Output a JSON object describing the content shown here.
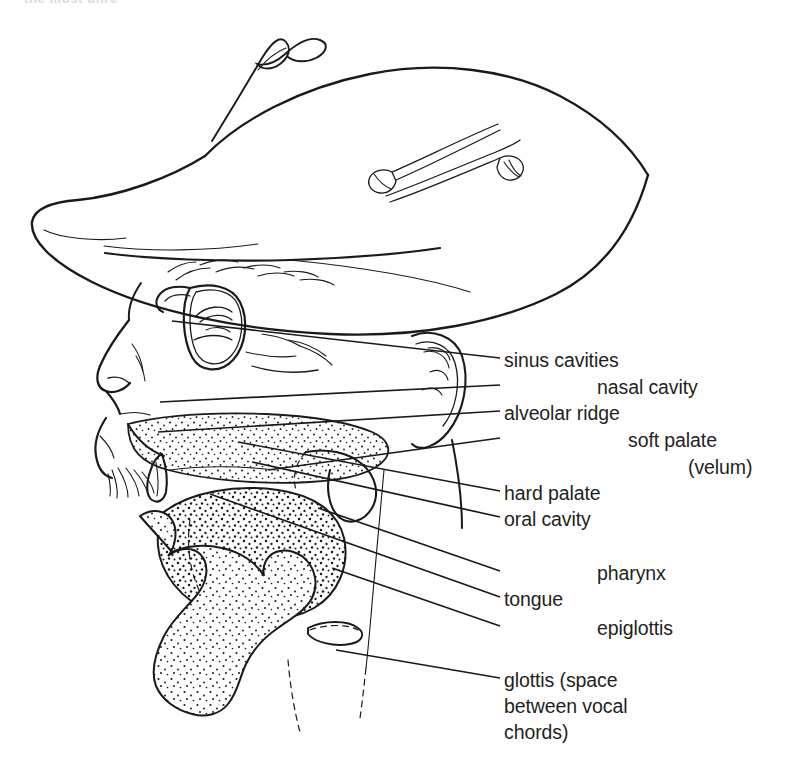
{
  "figure": {
    "clipped_header_text": "the most unre",
    "ink_color": "#1a1a1a",
    "text_color": "#231f20",
    "background_color": "#ffffff"
  },
  "labels": [
    {
      "id": "sinus-cavities",
      "text": "sinus cavities",
      "x": 504,
      "y": 348,
      "leader": true
    },
    {
      "id": "nasal-cavity",
      "text": "nasal cavity",
      "x": 597,
      "y": 375,
      "leader": true
    },
    {
      "id": "alveolar-ridge",
      "text": "alveolar ridge",
      "x": 504,
      "y": 401,
      "leader": true
    },
    {
      "id": "soft-palate",
      "text": "soft palate",
      "x": 628,
      "y": 428,
      "leader": true
    },
    {
      "id": "velum",
      "text": "(velum)",
      "x": 688,
      "y": 455,
      "leader": false
    },
    {
      "id": "hard-palate",
      "text": "hard palate",
      "x": 504,
      "y": 481,
      "leader": true
    },
    {
      "id": "oral-cavity",
      "text": "oral cavity",
      "x": 504,
      "y": 507,
      "leader": true
    },
    {
      "id": "pharynx",
      "text": "pharynx",
      "x": 597,
      "y": 561,
      "leader": true
    },
    {
      "id": "tongue",
      "text": "tongue",
      "x": 504,
      "y": 587,
      "leader": true
    },
    {
      "id": "epiglottis",
      "text": "epiglottis",
      "x": 597,
      "y": 616,
      "leader": true
    },
    {
      "id": "glottis-l1",
      "text": "glottis (space",
      "x": 504,
      "y": 668,
      "leader": true
    },
    {
      "id": "glottis-l2",
      "text": "between vocal",
      "x": 504,
      "y": 694,
      "leader": false
    },
    {
      "id": "glottis-l3",
      "text": "chords)",
      "x": 504,
      "y": 720,
      "leader": false
    }
  ],
  "anatomy_parts": [
    "sinus cavities",
    "nasal cavity",
    "alveolar ridge",
    "soft palate (velum)",
    "hard palate",
    "oral cavity",
    "pharynx",
    "tongue",
    "epiglottis",
    "glottis (space between vocal chords)"
  ]
}
